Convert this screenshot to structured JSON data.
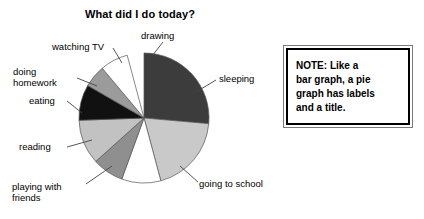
{
  "chart_title": "What did I do today?",
  "note": {
    "name": "note-box",
    "text": "NOTE: Like a\nbar graph, a pie\ngraph has labels\nand a title."
  },
  "chart_data": {
    "type": "pie",
    "title": "What did I do today?",
    "xlabel": "",
    "ylabel": "",
    "legend_position": "none",
    "grid": false,
    "labels_shown": true,
    "center": {
      "x": 144,
      "y": 118
    },
    "radius": 65,
    "start_angle_deg": 0,
    "direction": "clockwise",
    "categories": [
      "sleeping",
      "going to school",
      "playing with friends",
      "reading",
      "eating",
      "doing homework",
      "watching TV",
      "drawing"
    ],
    "values": [
      26.4,
      19.4,
      9.7,
      7.8,
      11.1,
      8.9,
      5.6,
      6.9
    ],
    "units": "percent of day",
    "slices": [
      {
        "label": "sleeping",
        "start_deg": 0,
        "end_deg": 95,
        "value": 26.4,
        "color": "#3c3c3c"
      },
      {
        "label": "going to school",
        "start_deg": 95,
        "end_deg": 165,
        "value": 19.4,
        "color": "#c9c9c9"
      },
      {
        "label": "playing with friends",
        "start_deg": 165,
        "end_deg": 200,
        "value": 9.7,
        "color": "#ffffff"
      },
      {
        "label": "reading",
        "start_deg": 200,
        "end_deg": 228,
        "value": 7.8,
        "color": "#8f8f8f"
      },
      {
        "label": "eating",
        "start_deg": 228,
        "end_deg": 268,
        "value": 11.1,
        "color": "#c2c2c2"
      },
      {
        "label": "doing homework",
        "start_deg": 268,
        "end_deg": 300,
        "value": 8.9,
        "color": "#111111"
      },
      {
        "label": "watching TV",
        "start_deg": 300,
        "end_deg": 320,
        "value": 5.6,
        "color": "#9b9b9b"
      },
      {
        "label": "drawing",
        "start_deg": 320,
        "end_deg": 345,
        "value": 6.9,
        "color": "#ffffff"
      }
    ],
    "leader_lines": [
      {
        "label": "drawing",
        "from": {
          "x": 152,
          "y": 56
        },
        "to": {
          "x": 163,
          "y": 42
        }
      },
      {
        "label": "sleeping",
        "from": {
          "x": 196,
          "y": 92
        },
        "to": {
          "x": 216,
          "y": 80
        }
      },
      {
        "label": "going to school",
        "from": {
          "x": 180,
          "y": 166
        },
        "to": {
          "x": 198,
          "y": 182
        }
      },
      {
        "label": "playing with friends",
        "from": {
          "x": 112,
          "y": 166
        },
        "to": {
          "x": 86,
          "y": 184
        }
      },
      {
        "label": "reading",
        "from": {
          "x": 92,
          "y": 140
        },
        "to": {
          "x": 67,
          "y": 147
        }
      },
      {
        "label": "eating",
        "from": {
          "x": 82,
          "y": 113
        },
        "to": {
          "x": 67,
          "y": 101
        }
      },
      {
        "label": "doing homework",
        "from": {
          "x": 97,
          "y": 86
        },
        "to": {
          "x": 77,
          "y": 78
        }
      },
      {
        "label": "watching TV",
        "from": {
          "x": 122,
          "y": 63
        },
        "to": {
          "x": 113,
          "y": 48
        }
      }
    ],
    "label_text": {
      "sleeping": "sleeping",
      "going_to_school": "going to school",
      "playing_with_friends": "playing with\nfriends",
      "reading": "reading",
      "eating": "eating",
      "doing_homework": "doing\nhomework",
      "watching_tv": "watching TV",
      "drawing": "drawing"
    }
  }
}
